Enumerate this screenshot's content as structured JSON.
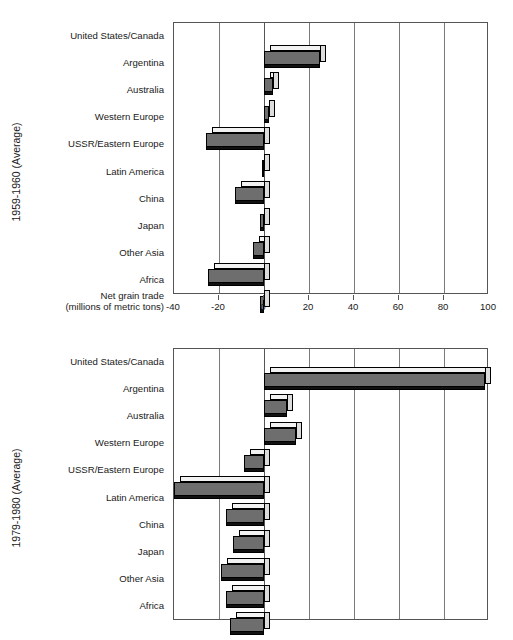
{
  "figure": {
    "background": "#ffffff",
    "bar_fill": "#6e6e6e",
    "bar_top": "#f2f2f2",
    "bar_side": "#dcdcdc",
    "axis_color": "#555555"
  },
  "axis_caption": {
    "line1": "Net grain trade",
    "line2": "(millions of metric tons)"
  },
  "categories": [
    "United States/Canada",
    "Argentina",
    "Australia",
    "Western Europe",
    "USSR/Eastern Europe",
    "Latin America",
    "China",
    "Japan",
    "Other Asia",
    "Africa"
  ],
  "ticklabels": [
    "-40",
    "-20",
    "0",
    "20",
    "40",
    "60",
    "80",
    "100"
  ],
  "panels": [
    {
      "ylabel": "1959-1960 (Average)"
    },
    {
      "ylabel": "1979-1980 (Average)"
    }
  ],
  "chart_data": [
    {
      "type": "bar",
      "orientation": "horizontal",
      "title": "1959-1960 (Average)",
      "xlabel": "Net grain trade (millions of metric tons)",
      "ylabel": "1959-1960 (Average)",
      "xlim": [
        -40,
        100
      ],
      "xticks": [
        -40,
        -20,
        0,
        20,
        40,
        60,
        80,
        100
      ],
      "grid": true,
      "legend": "none",
      "categories": [
        "United States/Canada",
        "Argentina",
        "Australia",
        "Western Europe",
        "USSR/Eastern Europe",
        "Latin America",
        "China",
        "Japan",
        "Other Asia",
        "Africa"
      ],
      "values": [
        25,
        4,
        2,
        -26,
        -1,
        -13,
        -2,
        -5,
        -25,
        -2
      ]
    },
    {
      "type": "bar",
      "orientation": "horizontal",
      "title": "1979-1980 (Average)",
      "xlabel": "Net grain trade (millions of metric tons)",
      "ylabel": "1979-1980 (Average)",
      "xlim": [
        -40,
        100
      ],
      "xticks": [
        -40,
        -20,
        0,
        20,
        40,
        60,
        80,
        100
      ],
      "grid": true,
      "legend": "none",
      "categories": [
        "United States/Canada",
        "Argentina",
        "Australia",
        "Western Europe",
        "USSR/Eastern Europe",
        "Latin America",
        "China",
        "Japan",
        "Other Asia",
        "Africa"
      ],
      "values": [
        98,
        10,
        14,
        -9,
        -40,
        -17,
        -14,
        -19,
        -17,
        -15
      ]
    }
  ]
}
